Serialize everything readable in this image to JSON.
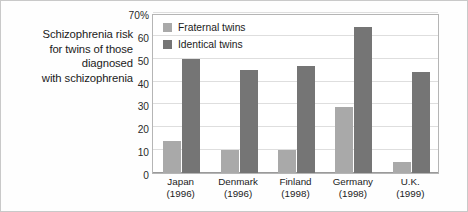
{
  "figure": {
    "caption_lines": [
      "Schizophrenia risk",
      "for twins of those",
      "diagnosed",
      "with schizophrenia"
    ]
  },
  "chart_data": {
    "type": "bar",
    "title": "Schizophrenia risk for twins of those diagnosed with schizophrenia",
    "xlabel": "",
    "ylabel": "",
    "ylim": [
      0,
      70
    ],
    "ytick_labels": [
      "0",
      "10",
      "20",
      "30",
      "40",
      "50",
      "60",
      "70%"
    ],
    "ytick_values": [
      0,
      10,
      20,
      30,
      40,
      50,
      60,
      70
    ],
    "grid": true,
    "legend_position": "top-left-inside",
    "categories": [
      "Japan",
      "Denmark",
      "Finland",
      "Germany",
      "U.K."
    ],
    "category_years": [
      "(1996)",
      "(1996)",
      "(1998)",
      "(1998)",
      "(1999)"
    ],
    "series": [
      {
        "name": "Fraternal twins",
        "color": "#a9a9a9",
        "values": [
          14,
          10,
          10,
          29,
          5
        ]
      },
      {
        "name": "Identical twins",
        "color": "#757575",
        "values": [
          50,
          45,
          47,
          64,
          44
        ]
      }
    ]
  },
  "colors": {
    "fraternal": "#a9a9a9",
    "identical": "#757575",
    "gridline": "#dedede",
    "axis": "#9a9a9a",
    "frame": "#c9c9c9",
    "text": "#1b1b1b",
    "background": "#fefefe"
  }
}
